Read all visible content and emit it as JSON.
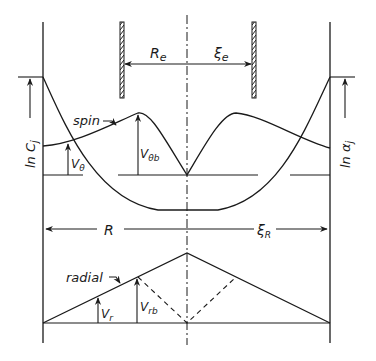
{
  "diagram": {
    "labels": {
      "Re": "R",
      "Re_sub": "e",
      "xi_e": "ξ",
      "xi_e_sub": "e",
      "ln_Cj": "ln C",
      "ln_Cj_sub": "j",
      "ln_alpha_j": "ln α",
      "ln_alpha_j_sub": "j",
      "spin": "spin",
      "V_theta": "V",
      "V_theta_sub": "θ",
      "V_theta_b": "V",
      "V_theta_b_sub": "θb",
      "R": "R",
      "xi_R": "ξ",
      "xi_R_sub": "R",
      "radial": "radial",
      "V_r": "V",
      "V_r_sub": "r",
      "V_rb": "V",
      "V_rb_sub": "rb"
    },
    "colors": {
      "line": "#1a1a1a",
      "background": "#ffffff"
    }
  }
}
